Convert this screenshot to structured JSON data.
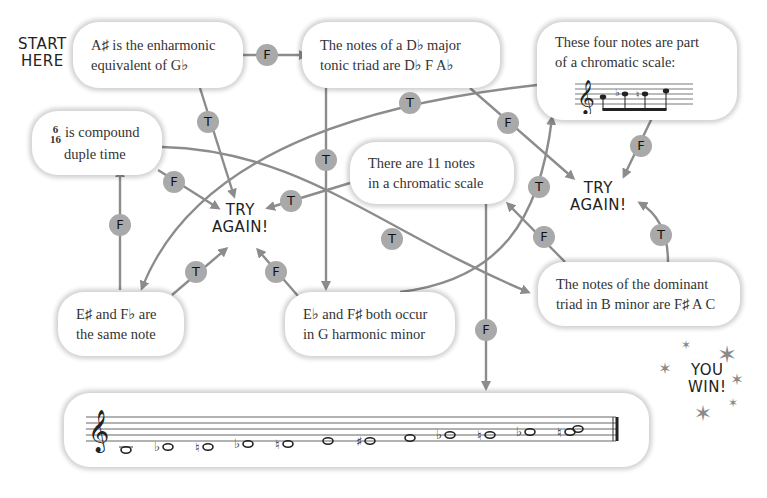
{
  "start_label": [
    "START",
    "HERE"
  ],
  "boxes": {
    "enharmonic": [
      "A♯ is the enharmonic",
      "equivalent of G♭"
    ],
    "db_triad": [
      "The notes of a D♭ major",
      "tonic triad are D♭ F A♭"
    ],
    "four_notes": [
      "These four notes are part",
      "of a chromatic scale:"
    ],
    "compound": {
      "fraction_top": "6",
      "fraction_bottom": "16",
      "lines": [
        "is compound",
        "duple time"
      ]
    },
    "eleven_notes": [
      "There are 11 notes",
      "in a chromatic scale"
    ],
    "e_sharp": [
      "E♯ and F♭ are",
      "the same note"
    ],
    "g_harmonic": [
      "E♭ and F♯ both occur",
      "in G harmonic minor"
    ],
    "b_minor": [
      "The notes of the dominant",
      "triad in B minor are F♯ A C"
    ]
  },
  "try_again": [
    {
      "id": "try-again-left",
      "lines": [
        "TRY",
        "AGAIN!"
      ]
    },
    {
      "id": "try-again-right",
      "lines": [
        "TRY",
        "AGAIN!"
      ]
    }
  ],
  "you_win": [
    "YOU",
    "WIN!"
  ],
  "badges": [
    {
      "label": "F",
      "x": 267,
      "y": 55
    },
    {
      "label": "T",
      "x": 208,
      "y": 122
    },
    {
      "label": "T",
      "x": 410,
      "y": 103
    },
    {
      "label": "T",
      "x": 326,
      "y": 160
    },
    {
      "label": "F",
      "x": 508,
      "y": 123
    },
    {
      "label": "F",
      "x": 641,
      "y": 146
    },
    {
      "label": "F",
      "x": 174,
      "y": 182
    },
    {
      "label": "T",
      "x": 291,
      "y": 201
    },
    {
      "label": "F",
      "x": 120,
      "y": 225
    },
    {
      "label": "T",
      "x": 392,
      "y": 239
    },
    {
      "label": "T",
      "x": 539,
      "y": 187
    },
    {
      "label": "F",
      "x": 544,
      "y": 237
    },
    {
      "label": "T",
      "x": 661,
      "y": 235
    },
    {
      "label": "T",
      "x": 196,
      "y": 272
    },
    {
      "label": "F",
      "x": 276,
      "y": 272
    },
    {
      "label": "F",
      "x": 486,
      "y": 330
    }
  ],
  "stave_notes": {
    "small_staff": [
      "A",
      "B♭",
      "B♮",
      "C"
    ],
    "final_scale": [
      "C",
      "D♭",
      "D♮",
      "E♭",
      "E♮",
      "F",
      "F♯",
      "G",
      "A♭",
      "A♮",
      "B♭",
      "B♮",
      "C"
    ]
  },
  "colors": {
    "line": "#8c8c8c",
    "badge": "#a9a9a9",
    "text": "#333333"
  }
}
